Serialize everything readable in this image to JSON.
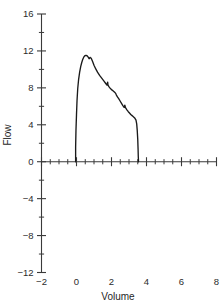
{
  "chart_data": {
    "type": "line",
    "title": "",
    "xlabel": "Volume",
    "ylabel": "Flow",
    "xlim": [
      -2,
      8
    ],
    "ylim": [
      -12,
      16
    ],
    "xticks": [
      -2,
      0,
      2,
      4,
      6,
      8
    ],
    "xtick_labels": [
      "−2",
      "0",
      "2",
      "4",
      "6",
      "8"
    ],
    "yticks": [
      -12,
      -8,
      -4,
      0,
      4,
      8,
      12,
      16
    ],
    "ytick_labels": [
      "−12",
      "−8",
      "−4",
      "0",
      "4",
      "8",
      "12",
      "16"
    ],
    "x_minor_step": 0.5,
    "y_minor_step": 2,
    "grid": false,
    "legend": null,
    "series": [
      {
        "name": "Flow-volume loop",
        "color": "#1a1a1a",
        "x": [
          -0.05,
          -0.05,
          -0.03,
          0.0,
          0.03,
          0.07,
          0.12,
          0.18,
          0.24,
          0.3,
          0.36,
          0.42,
          0.48,
          0.54,
          0.6,
          0.66,
          0.72,
          0.78,
          0.84,
          0.92,
          1.0,
          1.1,
          1.2,
          1.32,
          1.44,
          1.56,
          1.66,
          1.74,
          1.78,
          1.8,
          1.86,
          1.94,
          2.02,
          2.1,
          2.18,
          2.24,
          2.28,
          2.34,
          2.42,
          2.5,
          2.58,
          2.66,
          2.72,
          2.76,
          2.8,
          2.88,
          2.96,
          3.04,
          3.1,
          3.16,
          3.22,
          3.28,
          3.34,
          3.4,
          3.44,
          3.47,
          3.5,
          3.52,
          3.53,
          3.54,
          3.54
        ],
        "y": [
          0.0,
          1.6,
          3.4,
          5.1,
          6.6,
          7.9,
          8.9,
          9.7,
          10.3,
          10.75,
          11.1,
          11.35,
          11.48,
          11.52,
          11.48,
          11.35,
          11.15,
          11.3,
          11.2,
          10.85,
          10.45,
          10.05,
          9.7,
          9.35,
          9.05,
          8.75,
          8.5,
          8.3,
          8.62,
          8.3,
          8.1,
          7.92,
          7.78,
          7.66,
          7.52,
          7.4,
          7.22,
          7.02,
          6.8,
          6.55,
          6.3,
          6.05,
          5.88,
          6.12,
          5.85,
          5.62,
          5.42,
          5.25,
          5.12,
          5.02,
          4.92,
          4.82,
          4.7,
          4.5,
          4.1,
          3.4,
          2.4,
          1.3,
          0.6,
          0.2,
          0.0
        ]
      }
    ]
  },
  "axis_title_x": "Volume",
  "axis_title_y": "Flow"
}
